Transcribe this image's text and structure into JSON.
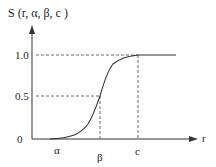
{
  "diagram": {
    "title": "S (r, α, β, c )",
    "type": "s-function membership curve",
    "y_axis": {
      "ticks": [
        {
          "label": "1.0",
          "value": 1.0
        },
        {
          "label": "0.5",
          "value": 0.5
        },
        {
          "label": "0",
          "value": 0
        }
      ]
    },
    "x_axis": {
      "label": "r",
      "ticks": [
        {
          "label": "α"
        },
        {
          "label": "β"
        },
        {
          "label": "c"
        }
      ]
    },
    "colors": {
      "line": "#333333",
      "background": "#ffffff"
    }
  }
}
